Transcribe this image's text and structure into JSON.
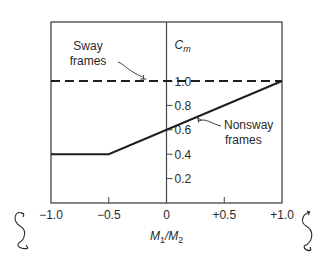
{
  "chart_data": {
    "type": "line",
    "title": "",
    "xlabel": "M1/M2",
    "xlabel_parts": {
      "m1": "M",
      "sub1": "1",
      "slash": "/",
      "m2": "M",
      "sub2": "2"
    },
    "ylabel": "Cm",
    "ylabel_parts": {
      "base": "C",
      "sub": "m"
    },
    "xlim": [
      -1.0,
      1.0
    ],
    "ylim": [
      0.0,
      1.2
    ],
    "grid": false,
    "x_ticks": [
      {
        "value": -1.0,
        "label": "−1.0"
      },
      {
        "value": -0.5,
        "label": "−0.5"
      },
      {
        "value": 0.0,
        "label": "0"
      },
      {
        "value": 0.5,
        "label": "+0.5"
      },
      {
        "value": 1.0,
        "label": "+1.0"
      }
    ],
    "y_ticks": [
      {
        "value": 0.2,
        "label": "0.2"
      },
      {
        "value": 0.4,
        "label": "0.4"
      },
      {
        "value": 0.6,
        "label": "0.6"
      },
      {
        "value": 0.8,
        "label": "0.8"
      },
      {
        "value": 1.0,
        "label": "1.0"
      }
    ],
    "series": [
      {
        "name": "Sway frames",
        "style": "dashed",
        "x": [
          -1.0,
          1.0
        ],
        "y": [
          1.0,
          1.0
        ]
      },
      {
        "name": "Nonsway frames",
        "style": "solid",
        "x": [
          -1.0,
          -0.5,
          1.0
        ],
        "y": [
          0.4,
          0.4,
          1.0
        ]
      }
    ],
    "annotations": [
      {
        "text_lines": [
          "Sway",
          "frames"
        ],
        "points_to_series": "Sway frames",
        "at": {
          "x": -0.2,
          "y": 1.0
        }
      },
      {
        "text_lines": [
          "Nonsway",
          "frames"
        ],
        "points_to_series": "Nonsway frames",
        "at": {
          "x": 0.27,
          "y": 0.708
        }
      }
    ],
    "end_symbols": [
      {
        "name": "double-curvature-moment-symbol",
        "side": "left"
      },
      {
        "name": "single-curvature-moment-symbol",
        "side": "right"
      }
    ]
  },
  "colors": {
    "line": "#1e1e1e",
    "frame": "#444444",
    "text": "#2a2a2a"
  }
}
